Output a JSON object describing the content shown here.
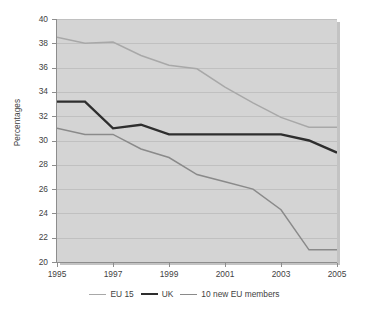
{
  "chart_data": {
    "type": "line",
    "title": "",
    "xlabel": "",
    "ylabel": "Percentages",
    "x": [
      1995,
      1996,
      1997,
      1998,
      1999,
      2000,
      2001,
      2002,
      2003,
      2004,
      2005
    ],
    "xlim": [
      1995,
      2005
    ],
    "ylim": [
      20,
      40
    ],
    "x_tick_labels": [
      "1995",
      "1997",
      "1999",
      "2001",
      "2003",
      "2005"
    ],
    "x_ticks": [
      1995,
      1997,
      1999,
      2001,
      2003,
      2005
    ],
    "y_tick_labels": [
      "20",
      "22",
      "24",
      "26",
      "28",
      "30",
      "32",
      "34",
      "36",
      "38",
      "40"
    ],
    "y_ticks": [
      20,
      22,
      24,
      26,
      28,
      30,
      32,
      34,
      36,
      38,
      40
    ],
    "grid": "horizontal",
    "legend_position": "bottom",
    "plot_background": "#d4d4d4",
    "series": [
      {
        "name": "EU 15",
        "color": "#a8a8a8",
        "width": 1.5,
        "values": [
          38.5,
          38.0,
          38.1,
          37.0,
          36.2,
          35.9,
          34.4,
          33.1,
          31.9,
          31.1,
          31.1
        ]
      },
      {
        "name": "UK",
        "color": "#2e2e2e",
        "width": 2.4,
        "values": [
          33.2,
          33.2,
          31.0,
          31.3,
          30.5,
          30.5,
          30.5,
          30.5,
          30.5,
          30.0,
          29.0
        ]
      },
      {
        "name": "10 new EU members",
        "color": "#8a8a8a",
        "width": 1.5,
        "values": [
          31.0,
          30.5,
          30.5,
          29.3,
          28.6,
          27.2,
          26.6,
          26.0,
          24.3,
          21.0,
          21.0
        ]
      }
    ]
  },
  "legend": {
    "items": [
      {
        "label": "EU 15",
        "color": "#a8a8a8",
        "width": 1.5
      },
      {
        "label": "UK",
        "color": "#2e2e2e",
        "width": 2.4
      },
      {
        "label": "10 new EU members",
        "color": "#8a8a8a",
        "width": 1.5
      }
    ]
  }
}
